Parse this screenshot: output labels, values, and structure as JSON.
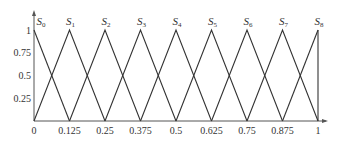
{
  "chart_data": {
    "type": "line",
    "title": "",
    "xlabel": "",
    "ylabel": "",
    "xlim": [
      0,
      1
    ],
    "ylim": [
      0,
      1
    ],
    "grid": false,
    "x_ticks": [
      "0",
      "0.125",
      "0.25",
      "0.375",
      "0.5",
      "0.625",
      "0.75",
      "0.875",
      "1"
    ],
    "y_ticks": [
      "0.25",
      "0.5",
      "0.75",
      "1"
    ],
    "series": [
      {
        "name": "S0",
        "x": [
          0,
          0.125
        ],
        "y": [
          1,
          0
        ]
      },
      {
        "name": "S1",
        "x": [
          0,
          0.125,
          0.25
        ],
        "y": [
          0,
          1,
          0
        ]
      },
      {
        "name": "S2",
        "x": [
          0.125,
          0.25,
          0.375
        ],
        "y": [
          0,
          1,
          0
        ]
      },
      {
        "name": "S3",
        "x": [
          0.25,
          0.375,
          0.5
        ],
        "y": [
          0,
          1,
          0
        ]
      },
      {
        "name": "S4",
        "x": [
          0.375,
          0.5,
          0.625
        ],
        "y": [
          0,
          1,
          0
        ]
      },
      {
        "name": "S5",
        "x": [
          0.5,
          0.625,
          0.75
        ],
        "y": [
          0,
          1,
          0
        ]
      },
      {
        "name": "S6",
        "x": [
          0.625,
          0.75,
          0.875
        ],
        "y": [
          0,
          1,
          0
        ]
      },
      {
        "name": "S7",
        "x": [
          0.75,
          0.875,
          1
        ],
        "y": [
          0,
          1,
          0
        ]
      },
      {
        "name": "S8",
        "x": [
          0.875,
          1
        ],
        "y": [
          0,
          1
        ]
      }
    ],
    "annotations": [
      {
        "text": "S",
        "sub": "0",
        "x": 0
      },
      {
        "text": "S",
        "sub": "1",
        "x": 0.125
      },
      {
        "text": "S",
        "sub": "2",
        "x": 0.25
      },
      {
        "text": "S",
        "sub": "3",
        "x": 0.375
      },
      {
        "text": "S",
        "sub": "4",
        "x": 0.5
      },
      {
        "text": "S",
        "sub": "5",
        "x": 0.625
      },
      {
        "text": "S",
        "sub": "6",
        "x": 0.75
      },
      {
        "text": "S",
        "sub": "7",
        "x": 0.875
      },
      {
        "text": "S",
        "sub": "8",
        "x": 1
      }
    ],
    "colors": {
      "line": "#333333",
      "axis": "#555555"
    }
  }
}
